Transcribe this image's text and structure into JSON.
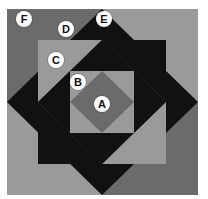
{
  "figure": {
    "colors": {
      "dark_gray": "#6b6b6b",
      "light_gray": "#9a9a9a",
      "black": "#111111",
      "label_bg": "#ffffff"
    },
    "labels": [
      {
        "id": "A",
        "text": "A",
        "x": 100,
        "y": 158
      },
      {
        "id": "B",
        "text": "B",
        "x": 78,
        "y": 108
      },
      {
        "id": "C",
        "text": "C",
        "x": 56,
        "y": 60
      },
      {
        "id": "D",
        "text": "D",
        "x": 66,
        "y": 29
      },
      {
        "id": "E",
        "text": "E",
        "x": 104,
        "y": 19
      },
      {
        "id": "F",
        "text": "F",
        "x": 24,
        "y": 19
      }
    ]
  }
}
